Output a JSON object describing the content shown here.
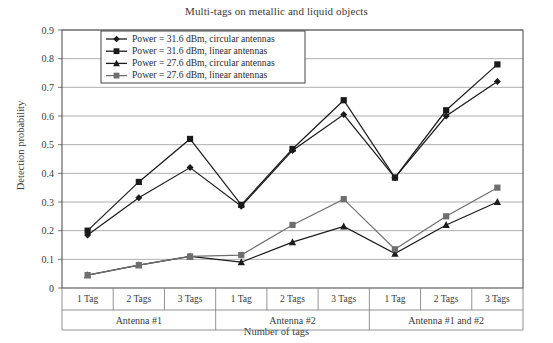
{
  "chart_data": {
    "type": "line",
    "title": "Multi-tags on metallic and liquid objects",
    "xlabel": "Number of tags",
    "ylabel": "Detection probability",
    "ylim": [
      0,
      0.9
    ],
    "ytick_labels": [
      "0",
      "0.1",
      "0.2",
      "0.3",
      "0.4",
      "0.5",
      "0.6",
      "0.7",
      "0.8",
      "0.9"
    ],
    "ytick_values": [
      0,
      0.1,
      0.2,
      0.3,
      0.4,
      0.5,
      0.6,
      0.7,
      0.8,
      0.9
    ],
    "grid": true,
    "legend_position": "top-left-inside",
    "categories": [
      "1 Tag",
      "2 Tags",
      "3 Tags",
      "1 Tag",
      "2 Tags",
      "3 Tags",
      "1 Tag",
      "2 Tags",
      "3 Tags"
    ],
    "groups": [
      {
        "label": "Antenna #1",
        "span": 3
      },
      {
        "label": "Antenna #2",
        "span": 3
      },
      {
        "label": "Antenna #1 and #2",
        "span": 3
      }
    ],
    "series": [
      {
        "name": "Power = 31.6 dBm, circular antennas",
        "marker": "diamond",
        "color": "#1a1a1a",
        "values": [
          0.185,
          0.315,
          0.42,
          0.285,
          0.48,
          0.605,
          0.385,
          0.6,
          0.72
        ]
      },
      {
        "name": "Power = 31.6 dBm, linear antennas",
        "marker": "square",
        "color": "#1a1a1a",
        "values": [
          0.2,
          0.37,
          0.52,
          0.29,
          0.485,
          0.655,
          0.385,
          0.62,
          0.78
        ]
      },
      {
        "name": "Power = 27.6 dBm, circular antennas",
        "marker": "triangle",
        "color": "#1a1a1a",
        "values": [
          0.045,
          0.08,
          0.11,
          0.09,
          0.16,
          0.215,
          0.12,
          0.22,
          0.3
        ]
      },
      {
        "name": "Power = 27.6 dBm, linear antennas",
        "marker": "square",
        "color": "#6e6e6e",
        "values": [
          0.045,
          0.08,
          0.11,
          0.115,
          0.22,
          0.31,
          0.135,
          0.25,
          0.35
        ]
      }
    ]
  }
}
